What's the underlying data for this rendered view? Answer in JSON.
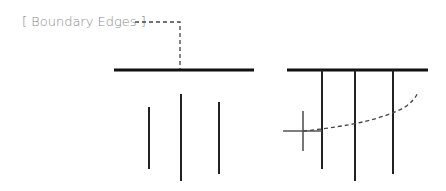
{
  "label": {
    "text": "[ Boundary Edges ]"
  },
  "colors": {
    "line": "#111111",
    "label": "#8a8a8a",
    "cross": "#555555",
    "dash": "#444444"
  },
  "diagrams": [
    {
      "name": "left",
      "top_edge": {
        "x1": 114,
        "x2": 254,
        "y": 70
      },
      "verticals": [
        {
          "x": 149,
          "y1": 107,
          "y2": 169
        },
        {
          "x": 181,
          "y1": 94,
          "y2": 181
        },
        {
          "x": 219,
          "y1": 102,
          "y2": 174
        }
      ]
    },
    {
      "name": "right",
      "top_edge": {
        "x1": 287,
        "x2": 428,
        "y": 70
      },
      "verticals": [
        {
          "x": 322,
          "y1": 70,
          "y2": 169
        },
        {
          "x": 355,
          "y1": 70,
          "y2": 181
        },
        {
          "x": 393,
          "y1": 70,
          "y2": 174
        }
      ]
    }
  ]
}
